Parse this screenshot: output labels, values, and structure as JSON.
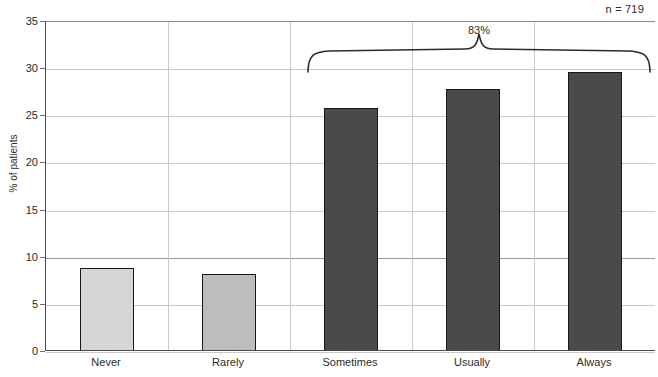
{
  "annotations": {
    "sample_size": "n = 719",
    "bracket_label": "83%"
  },
  "chart_data": {
    "type": "bar",
    "title": "",
    "xlabel": "",
    "ylabel": "% of patients",
    "categories": [
      "Never",
      "Rarely",
      "Sometimes",
      "Usually",
      "Always"
    ],
    "values": [
      8.8,
      8.2,
      25.8,
      27.8,
      29.6
    ],
    "bar_colors": [
      "#d5d5d5",
      "#bdbdbd",
      "#4a4a4a",
      "#4a4a4a",
      "#4a4a4a"
    ],
    "bar_edge_color": "#171717",
    "ylim": [
      0,
      35
    ],
    "ytick_labels": [
      "0",
      "5",
      "10",
      "15",
      "20",
      "25",
      "30",
      "35"
    ],
    "ytick_values": [
      0,
      5,
      10,
      15,
      20,
      25,
      30,
      35
    ],
    "grid": "horizontal-and-vertical",
    "legend": "none",
    "annotations": [
      {
        "text": "n = 719",
        "position": "top-right"
      },
      {
        "text": "83%",
        "position": "brace-over-last-three-bars",
        "covers": [
          "Sometimes",
          "Usually",
          "Always"
        ]
      }
    ]
  }
}
